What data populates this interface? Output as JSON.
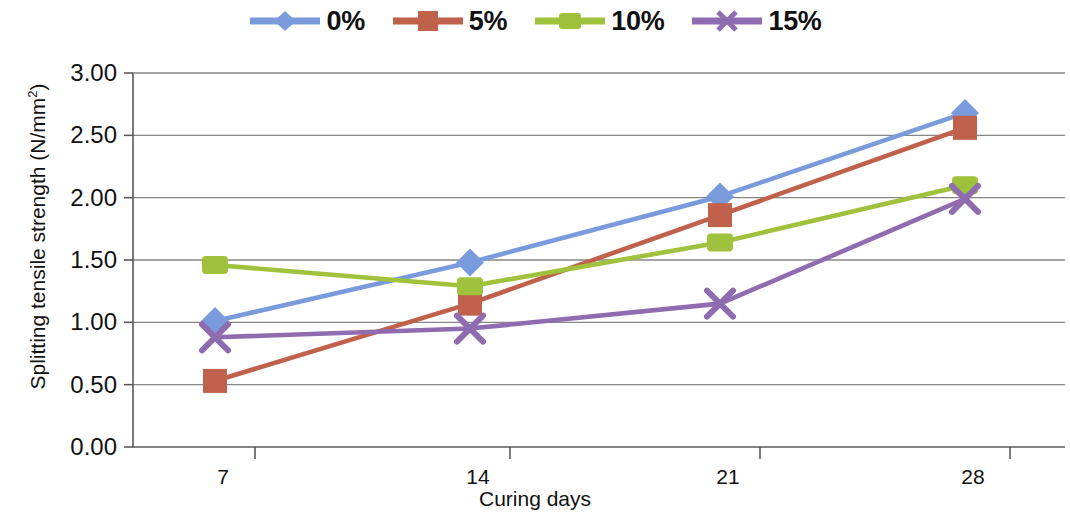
{
  "chart_data": {
    "type": "line",
    "title": "",
    "xlabel": "Curing days",
    "ylabel": "Splitting tensile strength (N/mm²)",
    "x": [
      7,
      14,
      21,
      28
    ],
    "xtick_labels": [
      "7",
      "14",
      "21",
      "28"
    ],
    "ytick_labels": [
      "0.00",
      "0.50",
      "1.00",
      "1.50",
      "2.00",
      "2.50",
      "3.00"
    ],
    "ytick_values": [
      0.0,
      0.5,
      1.0,
      1.5,
      2.0,
      2.5,
      3.0
    ],
    "ylim": [
      0.0,
      3.0
    ],
    "grid": "horizontal",
    "legend_position": "top-center",
    "series": [
      {
        "name": "0%",
        "color": "#7A9BDB",
        "marker": "diamond",
        "values": [
          1.01,
          1.48,
          2.01,
          2.68
        ]
      },
      {
        "name": "5%",
        "color": "#C0614C",
        "marker": "square",
        "values": [
          0.53,
          1.15,
          1.86,
          2.56
        ]
      },
      {
        "name": "10%",
        "color": "#9FC13C",
        "marker": "dash",
        "values": [
          1.46,
          1.29,
          1.64,
          2.1
        ]
      },
      {
        "name": "15%",
        "color": "#8F6BAF",
        "marker": "x",
        "values": [
          0.88,
          0.95,
          1.15,
          1.99
        ]
      }
    ]
  },
  "legend": {
    "items": [
      {
        "label": "0%",
        "color": "#7A9BDB",
        "marker": "diamond"
      },
      {
        "label": "5%",
        "color": "#C0614C",
        "marker": "square"
      },
      {
        "label": "10%",
        "color": "#9FC13C",
        "marker": "dash"
      },
      {
        "label": "15%",
        "color": "#8F6BAF",
        "marker": "x"
      }
    ]
  },
  "axes": {
    "y_title_main": "Splitting tensile strength (N/mm",
    "y_title_sup": "2",
    "y_title_tail": ")",
    "x_title": "Curing days"
  }
}
